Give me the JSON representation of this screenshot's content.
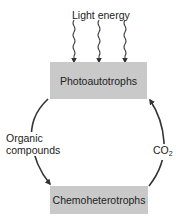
{
  "diagram": {
    "type": "cycle",
    "input": {
      "label": "Light energy",
      "arrow_count": 3,
      "target": "Photoautotrophs"
    },
    "nodes": [
      {
        "id": "photoautotrophs",
        "label": "Photoautotrophs"
      },
      {
        "id": "chemoheterotrophs",
        "label": "Chemoheterotrophs"
      }
    ],
    "edges": [
      {
        "from": "photoautotrophs",
        "to": "chemoheterotrophs",
        "label": "Organic compounds",
        "label_lines": [
          "Organic",
          "compounds"
        ]
      },
      {
        "from": "chemoheterotrophs",
        "to": "photoautotrophs",
        "label": "CO2",
        "label_main": "CO",
        "label_sub": "2"
      }
    ],
    "colors": {
      "box_fill": "#c9c9c9",
      "stroke": "#333333",
      "background": "#ffffff"
    }
  }
}
